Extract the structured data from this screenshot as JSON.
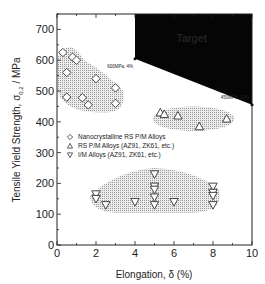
{
  "chart_data": {
    "type": "scatter",
    "title": "",
    "xlabel": "Elongation, δ (%)",
    "ylabel": "Tensile Yield Strength, σ0.2 / MPa",
    "xlim": [
      0,
      10
    ],
    "ylim": [
      0,
      750
    ],
    "x_ticks": [
      "0",
      "2",
      "4",
      "6",
      "8",
      "10"
    ],
    "y_ticks": [
      "0",
      "100",
      "200",
      "300",
      "400",
      "500",
      "600",
      "700"
    ],
    "grid": false,
    "legend_position": "center-left",
    "series": [
      {
        "name": "Nanocrystalline RS P/M Alloys",
        "marker": "diamond",
        "points": [
          [
            0.3,
            625
          ],
          [
            0.8,
            610
          ],
          [
            1.0,
            600
          ],
          [
            0.5,
            560
          ],
          [
            2.0,
            540
          ],
          [
            3.0,
            510
          ],
          [
            0.5,
            480
          ],
          [
            1.3,
            478
          ],
          [
            1.6,
            455
          ],
          [
            3.0,
            460
          ]
        ]
      },
      {
        "name": "RS P/M Alloys (AZ91, ZK61, etc.)",
        "marker": "triangle-up",
        "points": [
          [
            5.3,
            430
          ],
          [
            5.5,
            425
          ],
          [
            6.2,
            420
          ],
          [
            7.3,
            385
          ],
          [
            8.7,
            410
          ]
        ]
      },
      {
        "name": "I/M Alloys (AZ91, ZK61, etc.)",
        "marker": "triangle-down",
        "points": [
          [
            2.0,
            165
          ],
          [
            2.0,
            150
          ],
          [
            2.5,
            130
          ],
          [
            4.0,
            140
          ],
          [
            5.0,
            230
          ],
          [
            5.0,
            190
          ],
          [
            5.0,
            180
          ],
          [
            5.0,
            155
          ],
          [
            5.0,
            130
          ],
          [
            6.0,
            140
          ],
          [
            8.0,
            190
          ],
          [
            8.0,
            170
          ],
          [
            8.0,
            160
          ],
          [
            8.0,
            130
          ]
        ]
      }
    ],
    "annotations": [
      {
        "text": "600MPa, 4%",
        "x": 4,
        "y": 605
      },
      {
        "text": "450MPa, 10%",
        "x": 10,
        "y": 455
      },
      {
        "text": "Target",
        "region": "black polygon from (4,605) to (10,455) up to top-right corner"
      }
    ]
  },
  "labels": {
    "xlabel": "Elongation, δ (%)",
    "ylabel_main": "Tensile Yield Strength, σ",
    "ylabel_sub": "0.2",
    "ylabel_unit": " / MPa",
    "annot1": "600MPa, 4%",
    "annot2": "450MPa, 10%",
    "target": "Target",
    "legend": [
      "Nanocrystalline RS P/M Alloys",
      "RS P/M Alloys (AZ91, ZK61, etc.)",
      "I/M Alloys (AZ91, ZK61, etc.)"
    ]
  },
  "colors": {
    "target_fill": "#050505",
    "cluster_fill": "#d4d4d4",
    "marker_stroke": "#333333"
  }
}
